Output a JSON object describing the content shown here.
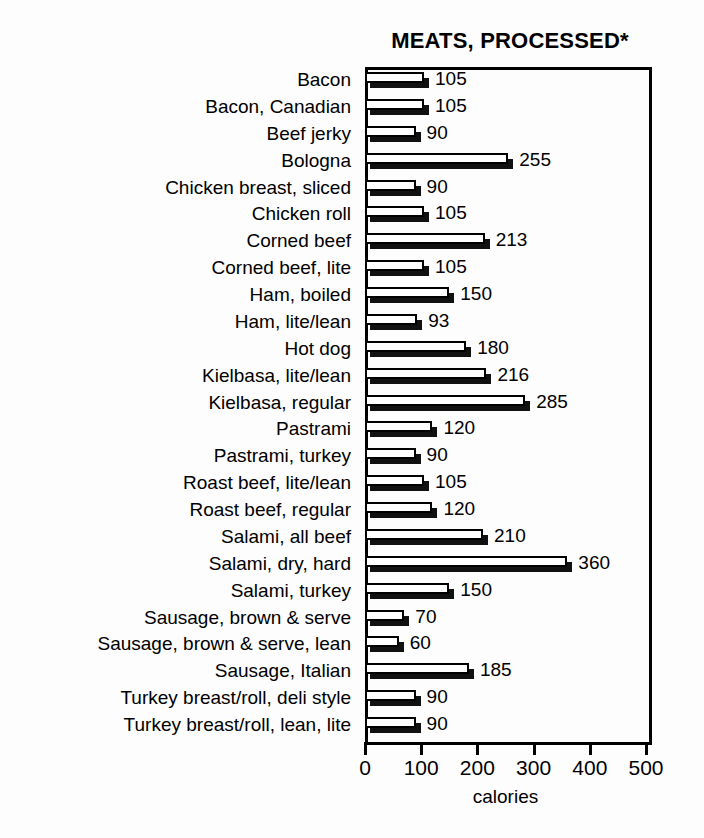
{
  "chart_data": {
    "type": "bar",
    "orientation": "horizontal",
    "title": "MEATS, PROCESSED*",
    "xlabel": "calories",
    "ylabel": "",
    "xlim": [
      0,
      500
    ],
    "xticks": [
      0,
      100,
      200,
      300,
      400,
      500
    ],
    "xtick_labels": [
      "0",
      "100",
      "200",
      "300",
      "400",
      "500"
    ],
    "grid": false,
    "legend": false,
    "categories": [
      "Bacon",
      "Bacon, Canadian",
      "Beef jerky",
      "Bologna",
      "Chicken breast, sliced",
      "Chicken roll",
      "Corned beef",
      "Corned beef, lite",
      "Ham, boiled",
      "Ham, lite/lean",
      "Hot dog",
      "Kielbasa, lite/lean",
      "Kielbasa, regular",
      "Pastrami",
      "Pastrami, turkey",
      "Roast beef, lite/lean",
      "Roast beef, regular",
      "Salami, all beef",
      "Salami, dry, hard",
      "Salami, turkey",
      "Sausage, brown & serve",
      "Sausage, brown & serve, lean",
      "Sausage, Italian",
      "Turkey breast/roll, deli style",
      "Turkey breast/roll, lean, lite"
    ],
    "values": [
      105,
      105,
      90,
      255,
      90,
      105,
      213,
      105,
      150,
      93,
      180,
      216,
      285,
      120,
      90,
      105,
      120,
      210,
      360,
      150,
      70,
      60,
      185,
      90,
      90
    ],
    "value_labels": [
      "105",
      "105",
      "90",
      "255",
      "90",
      "105",
      "213",
      "105",
      "150",
      "93",
      "180",
      "216",
      "285",
      "120",
      "90",
      "105",
      "120",
      "210",
      "360",
      "150",
      "70",
      "60",
      "185",
      "90",
      "90"
    ],
    "bar_face_color": "#ffffff",
    "bar_edge_color": "#000000",
    "bar_shadow_color": "#111111"
  }
}
